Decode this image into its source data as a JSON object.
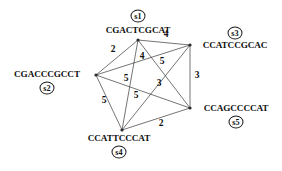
{
  "figure": {
    "type": "weighted-graph",
    "background_color": "#ffffff",
    "edge_color": "#3a3a3a",
    "text_color": "#111111"
  },
  "nodes": [
    {
      "id": "s1",
      "sequence": "CGACTCGCAT",
      "x": 138,
      "y": 40,
      "badge_x": 138,
      "badge_y": 16,
      "seq_x": 138,
      "seq_y": 31
    },
    {
      "id": "s2",
      "sequence": "CGACCCGCCT",
      "x": 96,
      "y": 75,
      "badge_x": 47,
      "badge_y": 88,
      "seq_x": 47,
      "seq_y": 75
    },
    {
      "id": "s3",
      "sequence": "CCATCCGCAC",
      "x": 190,
      "y": 45,
      "badge_x": 235,
      "badge_y": 33,
      "seq_x": 235,
      "seq_y": 46
    },
    {
      "id": "s4",
      "sequence": "CCATTCCCAT",
      "x": 122,
      "y": 130,
      "badge_x": 119,
      "badge_y": 152,
      "seq_x": 119,
      "seq_y": 139
    },
    {
      "id": "s5",
      "sequence": "CCAGCCCCAT",
      "x": 190,
      "y": 108,
      "badge_x": 236,
      "badge_y": 122,
      "seq_x": 236,
      "seq_y": 109
    }
  ],
  "edges": [
    {
      "from": "s1",
      "to": "s2",
      "weight": "2",
      "label_x": 113,
      "label_y": 50
    },
    {
      "from": "s1",
      "to": "s3",
      "weight": "4",
      "label_x": 166,
      "label_y": 35
    },
    {
      "from": "s1",
      "to": "s4",
      "weight": "4",
      "label_x": 142,
      "label_y": 57
    },
    {
      "from": "s1",
      "to": "s5",
      "weight": "5",
      "label_x": 162,
      "label_y": 62
    },
    {
      "from": "s2",
      "to": "s3",
      "weight": "5",
      "label_x": 126,
      "label_y": 79
    },
    {
      "from": "s2",
      "to": "s4",
      "weight": "5",
      "label_x": 104,
      "label_y": 101
    },
    {
      "from": "s2",
      "to": "s5",
      "weight": "5",
      "label_x": 136,
      "label_y": 96
    },
    {
      "from": "s3",
      "to": "s4",
      "weight": "3",
      "label_x": 159,
      "label_y": 84
    },
    {
      "from": "s3",
      "to": "s5",
      "weight": "3",
      "label_x": 197,
      "label_y": 76
    },
    {
      "from": "s4",
      "to": "s5",
      "weight": "2",
      "label_x": 161,
      "label_y": 124
    }
  ]
}
